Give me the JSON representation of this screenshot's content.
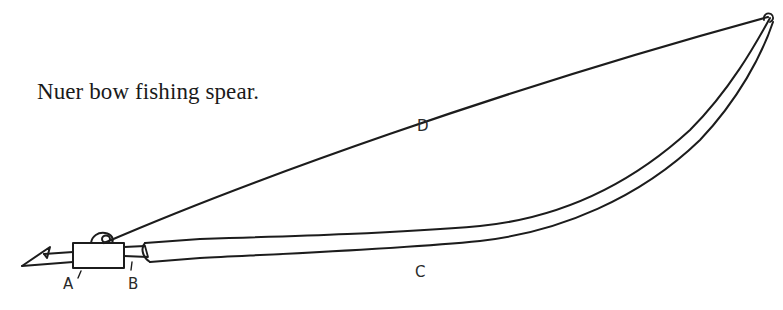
{
  "caption": "Nuer bow fishing spear.",
  "labels": {
    "A": "A",
    "B": "B",
    "C": "C",
    "D": "D"
  },
  "parts": [
    {
      "id": "A",
      "label": "A",
      "depicts": "barbed point and binding block"
    },
    {
      "id": "B",
      "label": "B",
      "depicts": "socket joint between point and shaft"
    },
    {
      "id": "C",
      "label": "C",
      "depicts": "curved bow shaft"
    },
    {
      "id": "D",
      "label": "D",
      "depicts": "bowstring"
    }
  ],
  "colors": {
    "ink": "#1c1c1c",
    "background": "#ffffff"
  }
}
